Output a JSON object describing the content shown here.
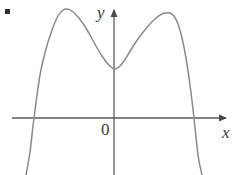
{
  "figure": {
    "background_color": "#ffffff",
    "width": 234,
    "height": 175,
    "bullet_marker": {
      "name": "item-bullet",
      "color": "#2e2e2e",
      "x": 7,
      "y": 11
    }
  },
  "labels": {
    "y_axis": "y",
    "x_axis": "x",
    "origin": "0"
  },
  "chart_data": {
    "type": "line",
    "title": "",
    "subtitle": "",
    "xlabel": "x",
    "ylabel": "y",
    "origin_label": "0",
    "grid": false,
    "legend": "none",
    "curve_color": "#8a8a8a",
    "axis_color": "#5a5a5a",
    "axes": {
      "x_axis_pixel_y": 118,
      "x_axis_pixel_x_start": 12,
      "x_axis_pixel_x_end": 228,
      "y_axis_pixel_x": 114,
      "y_axis_pixel_y_start": 8,
      "y_axis_pixel_y_end": 175,
      "arrow_x_tip": [
        228,
        118
      ],
      "arrow_y_tip": [
        114,
        8
      ],
      "xlim_pixels": [
        12,
        228
      ],
      "ylim_pixels": [
        8,
        175
      ]
    },
    "features": {
      "local_max_left": [
        67,
        9
      ],
      "local_min_center": [
        114,
        69
      ],
      "local_max_right": [
        170,
        13
      ],
      "x_intercept_left": [
        33,
        118
      ],
      "x_intercept_right": [
        193,
        118
      ],
      "y_intercept": [
        114,
        69
      ],
      "left_branch_exit": [
        30,
        175
      ],
      "right_branch_exit": [
        197,
        175
      ]
    },
    "x": [
      26,
      30,
      34,
      40,
      46,
      52,
      58,
      63,
      67,
      72,
      78,
      84,
      90,
      96,
      102,
      108,
      114,
      120,
      126,
      132,
      138,
      144,
      150,
      156,
      162,
      167,
      170,
      174,
      178,
      182,
      186,
      190,
      194,
      198,
      202
    ],
    "y": [
      175,
      152,
      118,
      75,
      49,
      30,
      16,
      10,
      9,
      11,
      17,
      25,
      35,
      46,
      56,
      64,
      69,
      66,
      58,
      48,
      39,
      31,
      24,
      18,
      14,
      13,
      13,
      16,
      24,
      38,
      58,
      85,
      118,
      155,
      175
    ]
  }
}
